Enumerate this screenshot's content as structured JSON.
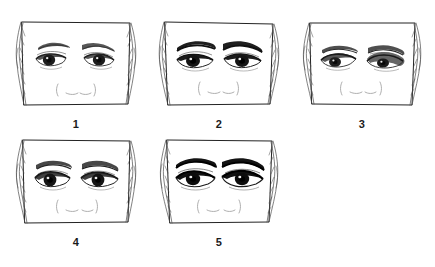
{
  "figure": {
    "title": "Eye and eyebrow variation plate",
    "background_color": "#ffffff",
    "ink_color": "#1b1b1b",
    "width": 435,
    "height": 267,
    "media": "scanned pen-and-ink line drawing",
    "layout": "two rows: three panels on top row, two panels on bottom row"
  },
  "panels": [
    {
      "number": "1",
      "label": "1",
      "row": 1,
      "column": 1,
      "x": 12,
      "y": 18,
      "width": 128,
      "height": 94,
      "description": "Cropped face band showing both eyes, eyebrows and the bridge of the nose",
      "brow_weight": "light",
      "lid_shading": "medium",
      "eye_shape": "almond, wide open",
      "nose_marks": "( __ __ )",
      "hair_strands": "both sides"
    },
    {
      "number": "2",
      "label": "2",
      "row": 1,
      "column": 2,
      "x": 155,
      "y": 18,
      "width": 128,
      "height": 94,
      "description": "Cropped face band showing both eyes with strong dark brows",
      "brow_weight": "heavy",
      "lid_shading": "heavy",
      "eye_shape": "almond, slightly narrowed",
      "nose_marks": "( __ __ )",
      "hair_strands": "both sides"
    },
    {
      "number": "3",
      "label": "3",
      "row": 1,
      "column": 3,
      "x": 298,
      "y": 18,
      "width": 128,
      "height": 94,
      "description": "Cropped face band showing hooded eyes with heavy upper lid mass",
      "brow_weight": "medium",
      "lid_shading": "hooded, heavy on right eye",
      "eye_shape": "hooded, downturned",
      "nose_marks": "( __ __ )",
      "hair_strands": "both sides"
    },
    {
      "number": "4",
      "label": "4",
      "row": 2,
      "column": 1,
      "x": 12,
      "y": 136,
      "width": 128,
      "height": 94,
      "description": "Cropped face band showing rounded eyes with dark irises",
      "brow_weight": "medium",
      "lid_shading": "medium-heavy",
      "eye_shape": "rounded, wide",
      "nose_marks": "( __ __ )",
      "hair_strands": "both sides"
    },
    {
      "number": "5",
      "label": "5",
      "row": 2,
      "column": 2,
      "x": 155,
      "y": 136,
      "width": 128,
      "height": 94,
      "description": "Cropped face band showing the darkest, most heavily shaded eyes and brows",
      "brow_weight": "very heavy",
      "lid_shading": "very heavy",
      "eye_shape": "almond, deep set",
      "nose_marks": "( __ __ )",
      "hair_strands": "both sides"
    }
  ]
}
